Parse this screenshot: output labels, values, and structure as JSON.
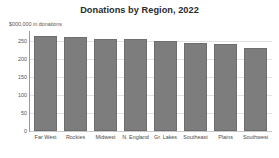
{
  "chart_data": {
    "type": "bar",
    "title": "Donations by Region, 2022",
    "subtitle": "$000,000 in donations",
    "xlabel": "",
    "ylabel": "",
    "categories": [
      "Far West",
      "Rockies",
      "Midwest",
      "N. England",
      "Gr. Lakes",
      "Southeast",
      "Plains",
      "Southwest"
    ],
    "values": [
      261,
      259,
      254,
      252,
      247,
      242,
      240,
      228
    ],
    "ylim": [
      0,
      275
    ],
    "yticks": [
      0,
      50,
      100,
      150,
      200,
      250
    ],
    "ytick_labels": [
      "0",
      "50",
      "100",
      "150",
      "200",
      "250"
    ],
    "grid": true,
    "legend": false,
    "bar_color": "#7d7d7d",
    "background_color": "#ffffff",
    "gridline_color": "#e2e2e2"
  }
}
